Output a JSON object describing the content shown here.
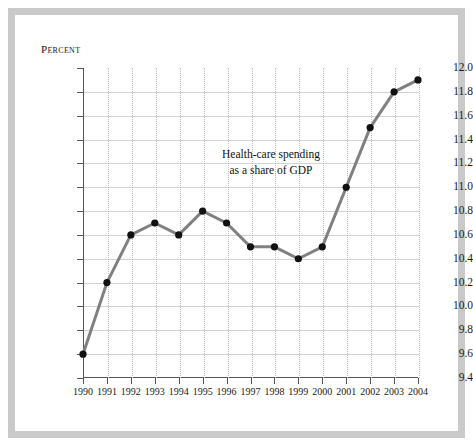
{
  "figure": {
    "unit_label": "Percent",
    "annotation_line1": "Health-care spending",
    "annotation_line2": "as a share of GDP",
    "line_color": "#808080",
    "marker_color": "#111111",
    "grid_color": "#d2d2d2",
    "axis_color": "#555555",
    "frame_color": "#c9c9c9",
    "background": "#ffffff"
  },
  "chart_data": {
    "type": "line",
    "title": "",
    "subtitle": "",
    "xlabel": "",
    "ylabel": "Percent",
    "annotation": "Health-care spending as a share of GDP",
    "grid": true,
    "legend": "none",
    "xlim": [
      1990,
      2004
    ],
    "ylim": [
      9.4,
      12.0
    ],
    "ytick_step": 0.2,
    "categories": [
      "1990",
      "1991",
      "1992",
      "1993",
      "1994",
      "1995",
      "1996",
      "1997",
      "1998",
      "1999",
      "2000",
      "2001",
      "2002",
      "2003",
      "2004"
    ],
    "x": [
      1990,
      1991,
      1992,
      1993,
      1994,
      1995,
      1996,
      1997,
      1998,
      1999,
      2000,
      2001,
      2002,
      2003,
      2004
    ],
    "values": [
      9.6,
      10.2,
      10.6,
      10.7,
      10.6,
      10.8,
      10.7,
      10.5,
      10.5,
      10.4,
      10.5,
      11.0,
      11.5,
      11.8,
      11.9
    ],
    "ytick_labels": [
      "12.0",
      "11.8",
      "11.6",
      "11.4",
      "11.2",
      "11.0",
      "10.8",
      "10.6",
      "10.4",
      "10.2",
      "10.0",
      "9.8",
      "9.6",
      "9.4"
    ],
    "xtick_labels": [
      "1990",
      "1991",
      "1992",
      "1993",
      "1994",
      "1995",
      "1996",
      "1997",
      "1998",
      "1999",
      "2000",
      "2001",
      "2002",
      "2003",
      "2004"
    ]
  }
}
